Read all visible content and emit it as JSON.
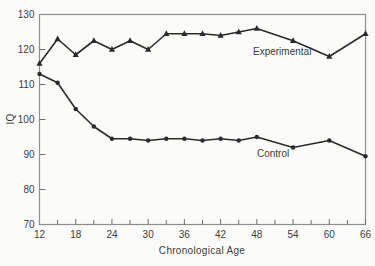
{
  "figure": {
    "background": "#fbfbf9",
    "frame_color": "#8f8f8f",
    "tick_color": "#6e6e6e",
    "text_color": "#3c3c3c",
    "line_color": "#2b2b2b"
  },
  "chart_data": {
    "type": "line",
    "title": "",
    "xlabel": "Chronological Age",
    "ylabel": "IQ",
    "xlim": [
      12,
      66
    ],
    "ylim": [
      70,
      130
    ],
    "x_major_ticks": [
      12,
      18,
      24,
      30,
      36,
      42,
      48,
      54,
      60,
      66
    ],
    "x_minor_tick_step": 3,
    "y_ticks": [
      70,
      80,
      90,
      100,
      110,
      120,
      130
    ],
    "grid": false,
    "legend_position": "inline-annotations",
    "x": [
      12,
      15,
      18,
      21,
      24,
      27,
      30,
      33,
      36,
      39,
      42,
      45,
      48,
      54,
      60,
      66
    ],
    "series": [
      {
        "name": "Experimental",
        "marker": "triangle",
        "values": [
          116,
          123,
          118.5,
          122.5,
          120,
          122.5,
          120,
          124.5,
          124.5,
          124.5,
          124,
          125,
          126,
          122.5,
          118,
          124.5
        ]
      },
      {
        "name": "Control",
        "marker": "circle",
        "values": [
          113,
          110.5,
          103,
          98,
          94.5,
          94.5,
          94,
          94.5,
          94.5,
          94,
          94.5,
          94,
          95,
          92,
          94,
          89.5
        ]
      }
    ],
    "annotations": [
      {
        "text": "Experimental",
        "x": 52.2,
        "y": 119.5
      },
      {
        "text": "Control",
        "x": 50.7,
        "y": 90.3
      }
    ]
  }
}
